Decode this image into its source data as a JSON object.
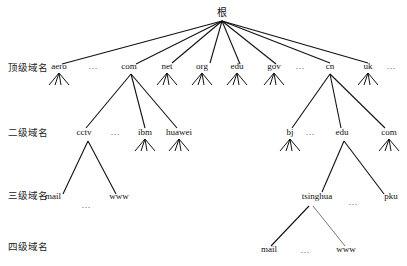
{
  "diagram": {
    "root": {
      "label": "根",
      "x": 222,
      "y": 16
    },
    "level_labels": [
      {
        "label": "顶级域名",
        "x": 8,
        "y": 71
      },
      {
        "label": "二级域名",
        "x": 8,
        "y": 136
      },
      {
        "label": "三级域名",
        "x": 8,
        "y": 199
      },
      {
        "label": "四级域名",
        "x": 8,
        "y": 250
      }
    ],
    "nodes": [
      {
        "id": "aero",
        "label": "aero",
        "x": 59,
        "y": 69,
        "fan": true
      },
      {
        "id": "com",
        "label": "com",
        "x": 129,
        "y": 69,
        "fan": false
      },
      {
        "id": "net",
        "label": "net",
        "x": 167,
        "y": 69,
        "fan": true
      },
      {
        "id": "org",
        "label": "org",
        "x": 202,
        "y": 69,
        "fan": true
      },
      {
        "id": "edu",
        "label": "edu",
        "x": 237,
        "y": 69,
        "fan": true
      },
      {
        "id": "gov",
        "label": "gov",
        "x": 274,
        "y": 69,
        "fan": true
      },
      {
        "id": "cn",
        "label": "cn",
        "x": 330,
        "y": 69,
        "fan": false
      },
      {
        "id": "uk",
        "label": "uk",
        "x": 368,
        "y": 69,
        "fan": true
      },
      {
        "id": "cctv",
        "label": "cctv",
        "x": 84,
        "y": 135,
        "fan": false
      },
      {
        "id": "ibm",
        "label": "ibm",
        "x": 145,
        "y": 135,
        "fan": true
      },
      {
        "id": "huawei",
        "label": "huawei",
        "x": 179,
        "y": 135,
        "fan": true
      },
      {
        "id": "bj",
        "label": "bj",
        "x": 290,
        "y": 135,
        "fan": true
      },
      {
        "id": "cn-edu",
        "label": "edu",
        "x": 342,
        "y": 135,
        "fan": false
      },
      {
        "id": "cn-com",
        "label": "com",
        "x": 389,
        "y": 135,
        "fan": true
      },
      {
        "id": "mail",
        "label": "mail",
        "x": 53,
        "y": 199,
        "fan": false
      },
      {
        "id": "cctv-www",
        "label": "www",
        "x": 119,
        "y": 199,
        "fan": false
      },
      {
        "id": "tsinghua",
        "label": "tsinghua",
        "x": 317,
        "y": 199,
        "fan": false
      },
      {
        "id": "pku",
        "label": "pku",
        "x": 391,
        "y": 199,
        "fan": false
      },
      {
        "id": "th-mail",
        "label": "mail",
        "x": 269,
        "y": 252,
        "fan": false
      },
      {
        "id": "th-www",
        "label": "www",
        "x": 346,
        "y": 252,
        "fan": false
      }
    ],
    "edges": [
      {
        "from": "root",
        "to": "aero",
        "x1": 222,
        "y1": 21,
        "x2": 62,
        "y2": 64
      },
      {
        "from": "root",
        "to": "com",
        "x1": 222,
        "y1": 21,
        "x2": 136,
        "y2": 64
      },
      {
        "from": "root",
        "to": "net",
        "x1": 222,
        "y1": 21,
        "x2": 172,
        "y2": 63
      },
      {
        "from": "root",
        "to": "org",
        "x1": 222,
        "y1": 21,
        "x2": 210,
        "y2": 63
      },
      {
        "from": "root",
        "to": "edu",
        "x1": 222,
        "y1": 21,
        "x2": 240,
        "y2": 64
      },
      {
        "from": "root",
        "to": "gov",
        "x1": 222,
        "y1": 21,
        "x2": 276,
        "y2": 64
      },
      {
        "from": "root",
        "to": "cn",
        "x1": 222,
        "y1": 21,
        "x2": 330,
        "y2": 63
      },
      {
        "from": "root",
        "to": "uk",
        "x1": 222,
        "y1": 21,
        "x2": 368,
        "y2": 63
      },
      {
        "from": "com",
        "to": "cctv",
        "x1": 131,
        "y1": 74,
        "x2": 86,
        "y2": 128
      },
      {
        "from": "com",
        "to": "ibm",
        "x1": 131,
        "y1": 74,
        "x2": 145,
        "y2": 128
      },
      {
        "from": "com",
        "to": "huawei",
        "x1": 131,
        "y1": 74,
        "x2": 177,
        "y2": 128
      },
      {
        "from": "cn",
        "to": "bj",
        "x1": 330,
        "y1": 74,
        "x2": 292,
        "y2": 128
      },
      {
        "from": "cn",
        "to": "cn-edu",
        "x1": 330,
        "y1": 74,
        "x2": 341,
        "y2": 128
      },
      {
        "from": "cn",
        "to": "cn-com",
        "x1": 330,
        "y1": 74,
        "x2": 385,
        "y2": 128
      },
      {
        "from": "cctv",
        "to": "mail",
        "x1": 88,
        "y1": 141,
        "x2": 63,
        "y2": 194
      },
      {
        "from": "cctv",
        "to": "cctv-www",
        "x1": 88,
        "y1": 141,
        "x2": 116,
        "y2": 194
      },
      {
        "from": "cn-edu",
        "to": "tsinghua",
        "x1": 344,
        "y1": 141,
        "x2": 322,
        "y2": 192
      },
      {
        "from": "cn-edu",
        "to": "pku",
        "x1": 344,
        "y1": 141,
        "x2": 384,
        "y2": 194
      },
      {
        "from": "tsinghua",
        "to": "th-mail",
        "x1": 309,
        "y1": 206,
        "x2": 271,
        "y2": 246
      },
      {
        "from": "tsinghua",
        "to": "th-www",
        "x1": 313,
        "y1": 206,
        "x2": 345,
        "y2": 246,
        "style": "light"
      }
    ],
    "ellipses": [
      {
        "id": "tld-dots-1",
        "label": "…",
        "x": 93,
        "y": 69
      },
      {
        "id": "tld-dots-2",
        "label": "…",
        "x": 300,
        "y": 69
      },
      {
        "id": "tld-dots-3",
        "label": "…",
        "x": 391,
        "y": 69
      },
      {
        "id": "sld-com-dots",
        "label": "…",
        "x": 115,
        "y": 135
      },
      {
        "id": "sld-cn-dots",
        "label": "…",
        "x": 310,
        "y": 135
      },
      {
        "id": "cctv-dots",
        "label": "…",
        "x": 86,
        "y": 208
      },
      {
        "id": "edu-dots",
        "label": "…",
        "x": 353,
        "y": 205
      },
      {
        "id": "th-dots",
        "label": "…",
        "x": 305,
        "y": 253
      }
    ]
  }
}
